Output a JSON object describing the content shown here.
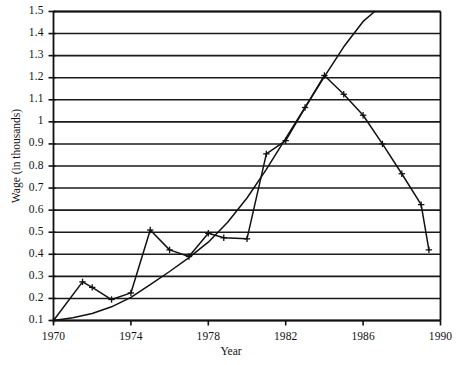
{
  "chart_data": {
    "type": "line",
    "title": "",
    "xlabel": "Year",
    "ylabel": "Wage (in thousands)",
    "xlim": [
      1970,
      1990
    ],
    "ylim": [
      0.1,
      1.5
    ],
    "xticks": [
      1970,
      1974,
      1978,
      1982,
      1986,
      1990
    ],
    "yticks": [
      0.1,
      0.2,
      0.3,
      0.4,
      0.5,
      0.6,
      0.7,
      0.8,
      0.9,
      1,
      1.1,
      1.2,
      1.3,
      1.4,
      1.5
    ],
    "ytick_labels": [
      "0.1",
      "0.2",
      "0.3",
      "0.4",
      "0.5",
      "0.6",
      "0.7",
      "0.8",
      "0.9",
      "1",
      "1.1",
      "1.2",
      "1.3",
      "1.4",
      "1.5"
    ],
    "xtick_labels": [
      "1970",
      "1974",
      "1978",
      "1982",
      "1986",
      "1990"
    ],
    "grid": "horizontal",
    "legend": "none",
    "series": [
      {
        "name": "observed-wage",
        "marker": "plus",
        "color": "#111111",
        "points": [
          {
            "x": 1970.0,
            "y": 0.1
          },
          {
            "x": 1971.5,
            "y": 0.275
          },
          {
            "x": 1972.0,
            "y": 0.25
          },
          {
            "x": 1973.0,
            "y": 0.195
          },
          {
            "x": 1974.0,
            "y": 0.225
          },
          {
            "x": 1975.0,
            "y": 0.51
          },
          {
            "x": 1976.0,
            "y": 0.42
          },
          {
            "x": 1977.0,
            "y": 0.39
          },
          {
            "x": 1978.0,
            "y": 0.495
          },
          {
            "x": 1978.8,
            "y": 0.475
          },
          {
            "x": 1980.0,
            "y": 0.47
          },
          {
            "x": 1981.0,
            "y": 0.855
          },
          {
            "x": 1982.0,
            "y": 0.915
          },
          {
            "x": 1983.0,
            "y": 1.065
          },
          {
            "x": 1984.0,
            "y": 1.21
          },
          {
            "x": 1985.0,
            "y": 1.125
          },
          {
            "x": 1986.0,
            "y": 1.03
          },
          {
            "x": 1987.0,
            "y": 0.9
          },
          {
            "x": 1988.0,
            "y": 0.765
          },
          {
            "x": 1989.0,
            "y": 0.625
          },
          {
            "x": 1989.4,
            "y": 0.42
          }
        ]
      },
      {
        "name": "fitted-trend-curve",
        "marker": "none",
        "color": "#111111",
        "points": [
          {
            "x": 1970.0,
            "y": 0.1
          },
          {
            "x": 1971.0,
            "y": 0.112
          },
          {
            "x": 1972.0,
            "y": 0.132
          },
          {
            "x": 1973.0,
            "y": 0.162
          },
          {
            "x": 1974.0,
            "y": 0.205
          },
          {
            "x": 1975.0,
            "y": 0.262
          },
          {
            "x": 1976.0,
            "y": 0.322
          },
          {
            "x": 1977.0,
            "y": 0.385
          },
          {
            "x": 1978.0,
            "y": 0.455
          },
          {
            "x": 1979.0,
            "y": 0.545
          },
          {
            "x": 1980.0,
            "y": 0.655
          },
          {
            "x": 1981.0,
            "y": 0.785
          },
          {
            "x": 1982.0,
            "y": 0.925
          },
          {
            "x": 1983.0,
            "y": 1.065
          },
          {
            "x": 1984.0,
            "y": 1.205
          },
          {
            "x": 1985.0,
            "y": 1.34
          },
          {
            "x": 1986.0,
            "y": 1.455
          },
          {
            "x": 1986.6,
            "y": 1.5
          }
        ]
      }
    ]
  },
  "style": {
    "axis_color": "#111111",
    "grid_color": "#1a1a1a",
    "plot_background": "#ffffff",
    "line_color": "#111111"
  }
}
